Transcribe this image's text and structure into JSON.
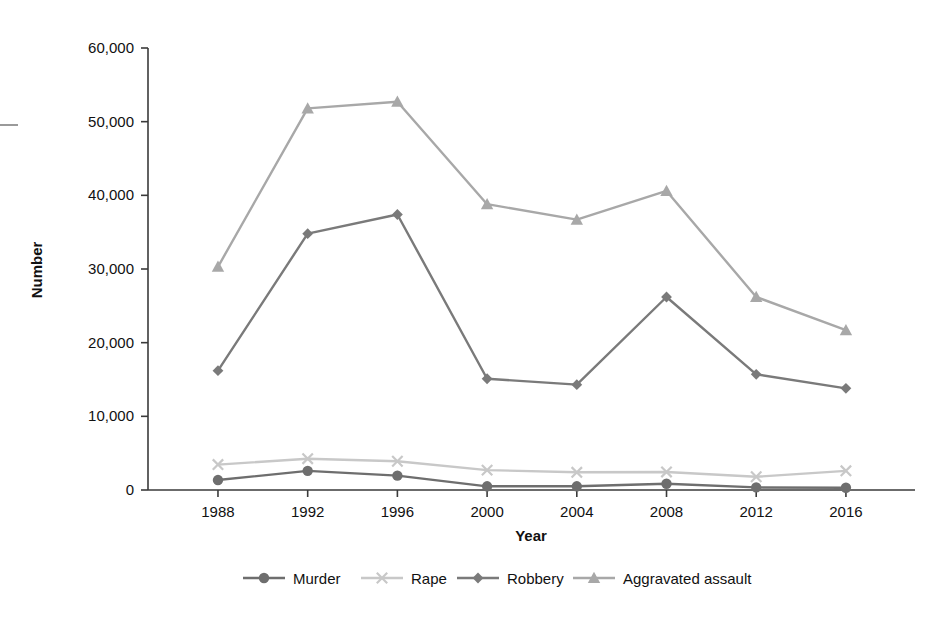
{
  "chart_data": {
    "type": "line",
    "title": "",
    "xlabel": "Year",
    "ylabel": "Number",
    "categories": [
      "1988",
      "1992",
      "1996",
      "2000",
      "2004",
      "2008",
      "2012",
      "2016"
    ],
    "x": [
      1988,
      1992,
      1996,
      2000,
      2004,
      2008,
      2012,
      2016
    ],
    "ylim": [
      0,
      60000
    ],
    "yticks": [
      0,
      10000,
      20000,
      30000,
      40000,
      50000,
      60000
    ],
    "ytick_labels": [
      "0",
      "10,000",
      "20,000",
      "30,000",
      "40,000",
      "50,000",
      "60,000"
    ],
    "grid": false,
    "legend_position": "bottom",
    "series": [
      {
        "name": "Murder",
        "marker": "circle",
        "color": "#6e6e6e",
        "values": [
          1350,
          2600,
          1950,
          500,
          500,
          850,
          350,
          300
        ]
      },
      {
        "name": "Rape",
        "marker": "x",
        "color": "#c8c8c8",
        "values": [
          3450,
          4250,
          3900,
          2700,
          2400,
          2450,
          1800,
          2600
        ]
      },
      {
        "name": "Robbery",
        "marker": "diamond",
        "color": "#7a7a7a",
        "values": [
          16200,
          34800,
          37400,
          15100,
          14300,
          26200,
          15700,
          13800
        ]
      },
      {
        "name": "Aggravated assault",
        "marker": "triangle",
        "color": "#a8a8a8",
        "values": [
          30300,
          51800,
          52700,
          38800,
          36700,
          40600,
          26200,
          21700
        ]
      }
    ]
  },
  "legend": {
    "items": [
      {
        "label": "Murder"
      },
      {
        "label": "Rape"
      },
      {
        "label": "Robbery"
      },
      {
        "label": "Aggravated assault"
      }
    ]
  },
  "axes": {
    "y_title": "Number",
    "x_title": "Year"
  }
}
